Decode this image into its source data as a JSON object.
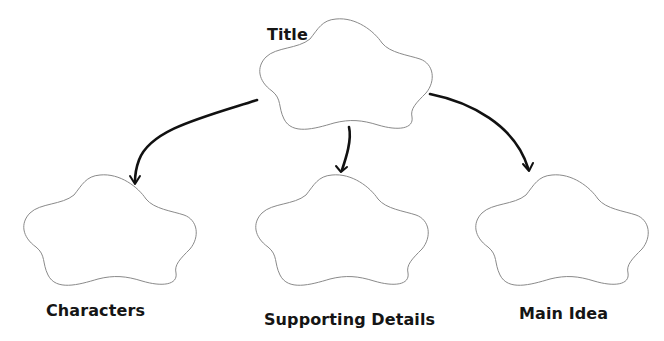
{
  "diagram": {
    "type": "graphic-organizer",
    "colors": {
      "background": "#ffffff",
      "cloud_outline": "#8a8a8a",
      "arrow": "#111111",
      "text": "#151515"
    },
    "nodes": [
      {
        "id": "title",
        "label": "Title",
        "shape": "cloud"
      },
      {
        "id": "characters",
        "label": "Characters",
        "shape": "cloud"
      },
      {
        "id": "supporting",
        "label": "Supporting Details",
        "shape": "cloud"
      },
      {
        "id": "main",
        "label": "Main Idea",
        "shape": "cloud"
      }
    ],
    "edges": [
      {
        "from": "title",
        "to": "characters"
      },
      {
        "from": "title",
        "to": "supporting"
      },
      {
        "from": "title",
        "to": "main"
      }
    ]
  }
}
